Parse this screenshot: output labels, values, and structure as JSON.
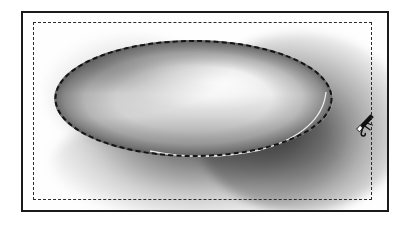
{
  "figure": {
    "palette": {
      "background": "#ffffff",
      "frame_stroke": "#1a1a1a",
      "dashed_stroke": "#2b2b2b",
      "rim_stroke": "#141414",
      "bowl_highlight": "#ffffff",
      "bowl_midtone": "#c8c8c8",
      "bowl_shade": "#8d8d8d",
      "cast_shadow": "#1e1e1e",
      "figure_fill": "#111111"
    },
    "frame": {
      "outer_label": "solid rectangular border",
      "inner_label": "dashed inner border"
    },
    "elements": {
      "bowl_label": "bowl ellipse",
      "rim_label": "dashed rim outline",
      "shadow_label": "cast shadow",
      "figure_label": "small figure on rim"
    }
  }
}
